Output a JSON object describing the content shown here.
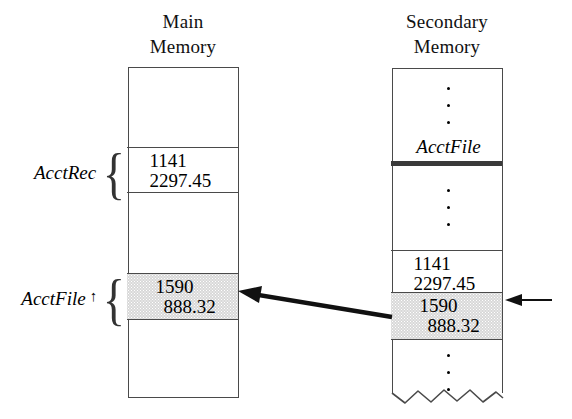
{
  "figure": {
    "type": "memory-diagram",
    "background_color": "#ffffff",
    "line_color": "#4a4a4a",
    "shade_color": "#d8d8d8"
  },
  "columns": {
    "main": {
      "heading": "Main\nMemory",
      "cells": [
        {
          "id": "main-empty-top",
          "lines": [],
          "shaded": false
        },
        {
          "id": "main-acctrec",
          "lines": [
            "1141",
            "2297.45"
          ],
          "shaded": false
        },
        {
          "id": "main-empty-mid",
          "lines": [],
          "shaded": false
        },
        {
          "id": "main-acctfile-ptr",
          "lines": [
            "1590",
            "888.32"
          ],
          "shaded": true
        },
        {
          "id": "main-empty-bottom",
          "lines": [],
          "shaded": false
        }
      ]
    },
    "secondary": {
      "heading": "Secondary\nMemory",
      "file_label": "AcctFile",
      "cells": [
        {
          "id": "sec-top-ellipsis",
          "lines": [],
          "shaded": false
        },
        {
          "id": "sec-mid-ellipsis",
          "lines": [],
          "shaded": false
        },
        {
          "id": "sec-record-1141",
          "lines": [
            "1141",
            "2297.45"
          ],
          "shaded": false
        },
        {
          "id": "sec-record-1590",
          "lines": [
            "1590",
            "888.32"
          ],
          "shaded": true
        },
        {
          "id": "sec-bottom-ellipsis",
          "lines": [],
          "shaded": false
        }
      ]
    }
  },
  "side_labels": {
    "acctrec": {
      "text": "AcctRec",
      "pointer_symbol": "",
      "brace": "{"
    },
    "acctfile_ptr": {
      "text": "AcctFile",
      "pointer_symbol": "↑",
      "brace": "{"
    }
  },
  "arrows": {
    "transfer": {
      "name": "record-transfer-arrow",
      "from": "secondary-record-1590",
      "to": "main-acctfile-ptr",
      "style": "thick-solid-left"
    },
    "current_position": {
      "name": "file-position-arrow",
      "points_to": "secondary-record-1590",
      "style": "thin-solid-left"
    }
  }
}
